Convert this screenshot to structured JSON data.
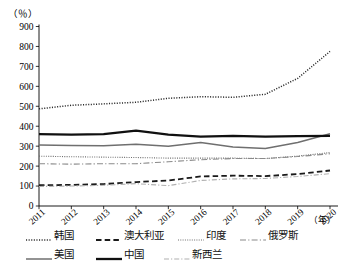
{
  "chart_data": {
    "type": "line",
    "title": "",
    "subtitle": "",
    "ylabel": "（％）",
    "xlabel": "（年）",
    "x": [
      2011,
      2012,
      2013,
      2014,
      2015,
      2016,
      2017,
      2018,
      2019,
      2020
    ],
    "xticklabels": [
      "2011",
      "2012",
      "2013",
      "2014",
      "2015",
      "2016",
      "2017",
      "2018",
      "2019",
      "2020"
    ],
    "yticklabels": [
      "0",
      "100",
      "200",
      "300",
      "400",
      "500",
      "600",
      "700",
      "800",
      "900"
    ],
    "yticks": [
      0,
      100,
      200,
      300,
      400,
      500,
      600,
      700,
      800,
      900
    ],
    "ylim": [
      0,
      900
    ],
    "grid": false,
    "legend_position": "bottom",
    "series": [
      {
        "name": "韩国",
        "style": "dotted",
        "color": "#2b2b2b",
        "values": [
          487,
          505,
          512,
          520,
          540,
          548,
          545,
          560,
          640,
          775
        ]
      },
      {
        "name": "澳大利亚",
        "style": "dashed",
        "color": "#1a1a1a",
        "values": [
          104,
          106,
          110,
          120,
          128,
          148,
          152,
          150,
          160,
          178
        ]
      },
      {
        "name": "印度",
        "style": "fine-dotted",
        "color": "#6e6e6e",
        "values": [
          250,
          247,
          245,
          243,
          240,
          240,
          240,
          238,
          250,
          268
        ]
      },
      {
        "name": "俄罗斯",
        "style": "dash-dot",
        "color": "#8a8a8a",
        "values": [
          212,
          210,
          212,
          212,
          222,
          232,
          238,
          238,
          248,
          262
        ]
      },
      {
        "name": "美国",
        "style": "solid",
        "color": "#6f6f6f",
        "values": [
          306,
          303,
          302,
          310,
          300,
          318,
          296,
          288,
          318,
          362
        ]
      },
      {
        "name": "中国",
        "style": "solid-bold",
        "color": "#101010",
        "values": [
          360,
          358,
          360,
          378,
          358,
          348,
          352,
          348,
          350,
          352
        ]
      },
      {
        "name": "新西兰",
        "style": "dash-dot-light",
        "color": "#b0b0b0",
        "values": [
          98,
          100,
          104,
          112,
          102,
          128,
          136,
          138,
          148,
          162
        ]
      }
    ]
  },
  "legend": {
    "rows": [
      [
        {
          "name": "韩国",
          "swatch": "dotted"
        },
        {
          "name": "澳大利亚",
          "swatch": "dashed"
        },
        {
          "name": "印度",
          "swatch": "fine-dotted"
        },
        {
          "name": "俄罗斯",
          "swatch": "dash-dot"
        }
      ],
      [
        {
          "name": "美国",
          "swatch": "solid"
        },
        {
          "name": "中国",
          "swatch": "solid-bold"
        },
        {
          "name": "新西兰",
          "swatch": "dash-dot-light"
        }
      ]
    ]
  }
}
